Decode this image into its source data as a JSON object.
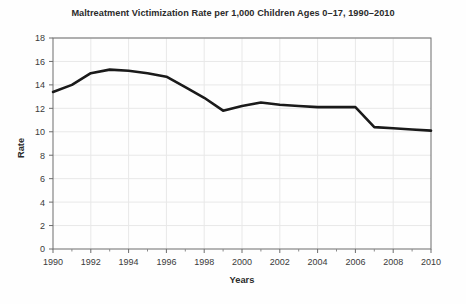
{
  "chart_data": {
    "type": "line",
    "title": "Maltreatment Victimization Rate per 1,000 Children Ages 0–17, 1990–2010",
    "xlabel": "Years",
    "ylabel": "Rate",
    "x": [
      1990,
      1991,
      1992,
      1993,
      1994,
      1995,
      1996,
      1997,
      1998,
      1999,
      2000,
      2001,
      2002,
      2003,
      2004,
      2005,
      2006,
      2007,
      2008,
      2009,
      2010
    ],
    "values": [
      13.4,
      14.0,
      15.0,
      15.3,
      15.2,
      15.0,
      14.7,
      13.8,
      12.9,
      11.8,
      12.2,
      12.5,
      12.3,
      12.2,
      12.1,
      12.1,
      12.1,
      10.4,
      10.3,
      10.2,
      10.1
    ],
    "series": [
      {
        "name": "Maltreatment victimization rate",
        "values": [
          13.4,
          14.0,
          15.0,
          15.3,
          15.2,
          15.0,
          14.7,
          13.8,
          12.9,
          11.8,
          12.2,
          12.5,
          12.3,
          12.2,
          12.1,
          12.1,
          12.1,
          10.4,
          10.3,
          10.2,
          10.1
        ],
        "color": "#1a1a1a"
      }
    ],
    "xlim": [
      1990,
      2010
    ],
    "ylim": [
      0,
      18
    ],
    "ytick_labels": [
      "0",
      "2",
      "4",
      "6",
      "8",
      "10",
      "12",
      "14",
      "16",
      "18"
    ],
    "yticks": [
      0,
      2,
      4,
      6,
      8,
      10,
      12,
      14,
      16,
      18
    ],
    "xtick_labels": [
      "1990",
      "1992",
      "1994",
      "1996",
      "1998",
      "2000",
      "2002",
      "2004",
      "2006",
      "2008",
      "2010"
    ],
    "xticks": [
      1990,
      1992,
      1994,
      1996,
      1998,
      2000,
      2002,
      2004,
      2006,
      2008,
      2010
    ],
    "x_minor_ticks": [
      1991,
      1993,
      1995,
      1997,
      1999,
      2001,
      2003,
      2005,
      2007,
      2009
    ],
    "grid": true,
    "legend": null,
    "grid_color": "#e8e8e8",
    "frame_color": "#6d6d6d",
    "background": "#fefefe"
  }
}
